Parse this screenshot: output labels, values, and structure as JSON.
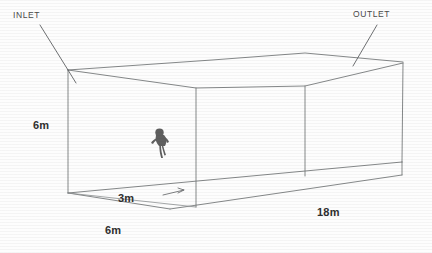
{
  "diagram": {
    "title_visible": false,
    "type": "3d-wireframe-duct",
    "labels": {
      "inlet": "INLET",
      "outlet": "OUTLET",
      "height": "6m",
      "inner": "3m",
      "width": "6m",
      "length": "18m"
    },
    "dimensions": [
      {
        "name": "height",
        "value": "6m"
      },
      {
        "name": "inner-offset",
        "value": "3m"
      },
      {
        "name": "width",
        "value": "6m"
      },
      {
        "name": "length",
        "value": "18m"
      }
    ],
    "colors": {
      "wireframe": "#777a7c",
      "leader": "#5d6062",
      "text": "#3c3c3c",
      "figure": "#5f5f5f",
      "background": "#fdfdfd"
    },
    "figure": {
      "name": "person-silhouette",
      "description": "dark crouching figure inside duct"
    }
  }
}
